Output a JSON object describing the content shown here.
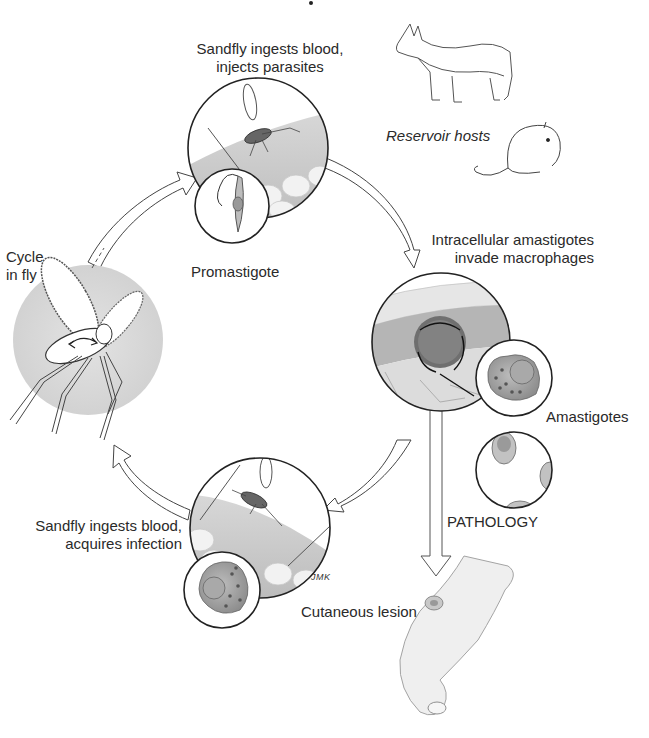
{
  "diagram": {
    "title_fragment": "…",
    "type": "life-cycle",
    "colors": {
      "background": "#ffffff",
      "stroke": "#2a2a2a",
      "skin_tone": "#cfcfcf",
      "fly_circle": "#dadada",
      "text": "#2a2a2a"
    },
    "stages": [
      {
        "id": "inject",
        "label_lines": [
          "Sandfly ingests blood,",
          "injects parasites"
        ],
        "inset_label": "Promastigote"
      },
      {
        "id": "invade",
        "label_lines": [
          "Intracellular amastigotes",
          "invade macrophages"
        ],
        "inset_label": "Amastigotes"
      },
      {
        "id": "acquire",
        "label_lines": [
          "Sandfly ingests blood,",
          "acquires infection"
        ]
      },
      {
        "id": "fly_cycle",
        "label_lines": [
          "Cycle",
          "in fly"
        ]
      }
    ],
    "reservoir": {
      "label": "Reservoir hosts",
      "animals": [
        "canine",
        "rodent"
      ]
    },
    "pathology": {
      "arrow_label": "PATHOLOGY",
      "outcome_label": "Cutaneous lesion"
    },
    "artist_signature": "JMK",
    "cycle_arrows": [
      {
        "from": "fly_cycle",
        "to": "inject"
      },
      {
        "from": "inject",
        "to": "invade"
      },
      {
        "from": "invade",
        "to": "acquire"
      },
      {
        "from": "acquire",
        "to": "fly_cycle"
      },
      {
        "from": "invade",
        "to": "pathology"
      }
    ]
  }
}
